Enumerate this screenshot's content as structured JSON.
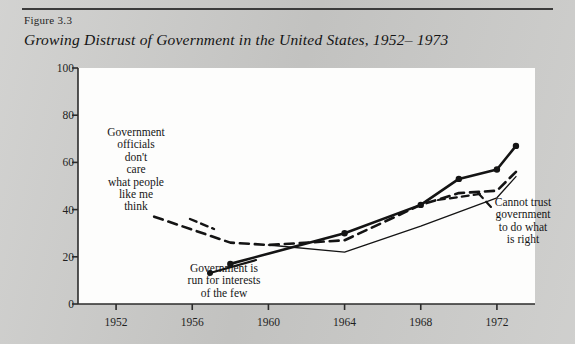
{
  "figure": {
    "number_label": "Figure 3.3",
    "title": "Growing Distrust of Government in the United States, 1952– 1973"
  },
  "chart_data": {
    "type": "line",
    "title": "Growing Distrust of Government in the United States, 1952– 1973",
    "xlabel": "",
    "ylabel": "Percentage of respondents",
    "xlim": [
      1950,
      1974
    ],
    "ylim": [
      0,
      100
    ],
    "xticks": [
      1952,
      1956,
      1960,
      1964,
      1968,
      1972
    ],
    "yticks": [
      0,
      20,
      40,
      60,
      80,
      100
    ],
    "grid": false,
    "legend": "annotations",
    "series": [
      {
        "name": "Government officials don't care what people like me think",
        "style": "dashed",
        "x": [
          1954,
          1958,
          1960,
          1964,
          1968,
          1970,
          1972,
          1973
        ],
        "values": [
          37,
          26,
          25,
          27,
          42,
          47,
          48,
          56
        ]
      },
      {
        "name": "Government is run for interests of the few",
        "style": "solid-thick-markers",
        "markers": true,
        "x": [
          1958,
          1964,
          1968,
          1970,
          1972,
          1973
        ],
        "values": [
          17,
          30,
          42,
          53,
          57,
          67
        ]
      },
      {
        "name": "Cannot trust government to do what is right",
        "style": "solid-thin",
        "x": [
          1960,
          1964,
          1968,
          1972,
          1973
        ],
        "values": [
          25,
          22,
          33,
          45,
          54
        ]
      }
    ],
    "annotations": [
      {
        "id": "officials",
        "text": "Government\nofficials\ndon't\ncare\nwhat people\nlike me\nthink",
        "points_to_series": "Government officials don't care what people like me think"
      },
      {
        "id": "interests",
        "text": "Government is\nrun for interests\nof the few",
        "points_to_series": "Government is run for interests of the few"
      },
      {
        "id": "cannot-trust",
        "text": "Cannot trust\ngovernment\nto do what\nis right",
        "points_to_series": "Cannot trust government to do what is right"
      }
    ]
  },
  "colors": {
    "page_background": "#c9c9c7",
    "plot_background": "#fdfdfc",
    "ink": "#141414",
    "axis": "#2b2b2b"
  }
}
